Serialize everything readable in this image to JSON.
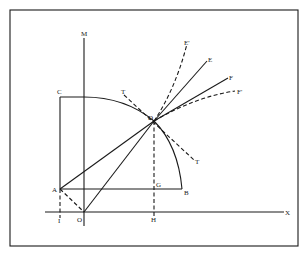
{
  "diagram": {
    "type": "geometric construction",
    "points": {
      "M": {
        "label": "M"
      },
      "C": {
        "label": "C"
      },
      "T1": {
        "label": "T"
      },
      "D": {
        "label": "D"
      },
      "E_prime": {
        "label": "E'"
      },
      "E": {
        "label": "E"
      },
      "F": {
        "label": "F"
      },
      "F_prime": {
        "label": "F'"
      },
      "T2": {
        "label": "T"
      },
      "A": {
        "label": "A"
      },
      "G": {
        "label": "G"
      },
      "B": {
        "label": "B"
      },
      "I": {
        "label": "I"
      },
      "O": {
        "label": "O"
      },
      "H": {
        "label": "H"
      },
      "X": {
        "label": "X"
      }
    },
    "colors": {
      "line": "#1a1a1a",
      "background": "#ffffff"
    }
  }
}
